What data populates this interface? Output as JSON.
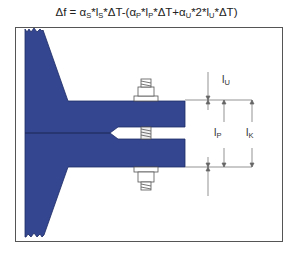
{
  "formula": {
    "prefix": "Δf = α",
    "s1": "S",
    "t1": "*l",
    "s2": "S",
    "t2": "*ΔT-(α",
    "s3": "P",
    "t3": "*l",
    "s4": "P",
    "t4": "*ΔT+α",
    "s5": "U",
    "t5": "*2*l",
    "s6": "U",
    "t6": "*ΔT)"
  },
  "labels": {
    "lu": {
      "main": "l",
      "sub": "U"
    },
    "lp": {
      "main": "l",
      "sub": "P"
    },
    "lk": {
      "main": "l",
      "sub": "K"
    }
  },
  "colors": {
    "part_fill": "#34468f",
    "outline": "#555555"
  }
}
